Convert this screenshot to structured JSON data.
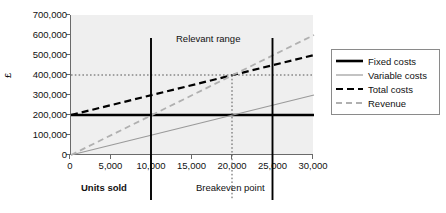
{
  "chart_data": {
    "type": "line",
    "title": "",
    "xlabel": "Units sold",
    "ylabel": "£",
    "xlim": [
      0,
      30000
    ],
    "ylim": [
      0,
      700000
    ],
    "grid": false,
    "legend_position": "right",
    "x_ticks": [
      "0",
      "5,000",
      "10,000",
      "15,000",
      "20,000",
      "25,000",
      "30,000"
    ],
    "x_tick_values": [
      0,
      5000,
      10000,
      15000,
      20000,
      25000,
      30000
    ],
    "y_ticks": [
      "0",
      "100,000",
      "200,000",
      "300,000",
      "400,000",
      "500,000",
      "600,000",
      "700,000"
    ],
    "y_tick_values": [
      0,
      100000,
      200000,
      300000,
      400000,
      500000,
      600000,
      700000
    ],
    "series": [
      {
        "name": "Fixed costs",
        "style": "solid",
        "color": "#000000",
        "width": 2.4,
        "x": [
          0,
          30000
        ],
        "values": [
          200000,
          200000
        ]
      },
      {
        "name": "Variable costs",
        "style": "solid",
        "color": "#9a9a9a",
        "width": 1.2,
        "x": [
          0,
          30000
        ],
        "values": [
          0,
          300000
        ]
      },
      {
        "name": "Total costs",
        "style": "dashed",
        "color": "#000000",
        "width": 2.2,
        "x": [
          0,
          30000
        ],
        "values": [
          200000,
          500000
        ]
      },
      {
        "name": "Revenue",
        "style": "dashed",
        "color": "#b0b0b0",
        "width": 1.8,
        "x": [
          0,
          30000
        ],
        "values": [
          0,
          600000
        ]
      }
    ],
    "annotations": [
      {
        "name": "relevant-range-label",
        "text": "Relevant range",
        "type": "text"
      },
      {
        "name": "units-sold-label",
        "text": "Units sold",
        "type": "text"
      },
      {
        "name": "breakeven-point-label",
        "text": "Breakeven point",
        "type": "text"
      },
      {
        "name": "relevant-range-lower-bound",
        "type": "vline",
        "x": 10000,
        "style": "solid",
        "color": "#000000"
      },
      {
        "name": "relevant-range-upper-bound",
        "type": "vline",
        "x": 25000,
        "style": "solid",
        "color": "#000000"
      },
      {
        "name": "breakeven-guide-vertical",
        "type": "vline",
        "x": 20000,
        "style": "dotted",
        "color": "#555555"
      },
      {
        "name": "breakeven-guide-horizontal",
        "type": "hline",
        "y": 400000,
        "style": "dotted",
        "color": "#555555"
      }
    ],
    "breakeven_point": {
      "units": 20000,
      "value": 400000
    }
  },
  "axes": {
    "y_title": "£",
    "y_tick_labels": [
      "700,000",
      "600,000",
      "500,000",
      "400,000",
      "300,000",
      "200,000",
      "100,000",
      "0"
    ],
    "x_tick_labels": [
      "0",
      "5,000",
      "10,000",
      "15,000",
      "20,000",
      "25,000",
      "30,000"
    ]
  },
  "annotations": {
    "relevant_range": "Relevant range",
    "units_sold": "Units sold",
    "breakeven_point": "Breakeven point"
  },
  "legend": {
    "items": [
      {
        "label": "Fixed costs",
        "style": "solid",
        "color": "#000000"
      },
      {
        "label": "Variable costs",
        "style": "solid",
        "color": "#9a9a9a"
      },
      {
        "label": "Total costs",
        "style": "dashed",
        "color": "#000000"
      },
      {
        "label": "Revenue",
        "style": "dashed",
        "color": "#b0b0b0"
      }
    ]
  },
  "colors": {
    "plot_background": "#efefef",
    "page_background": "#ffffff",
    "axis": "#6a6a6a",
    "text": "#111111"
  }
}
